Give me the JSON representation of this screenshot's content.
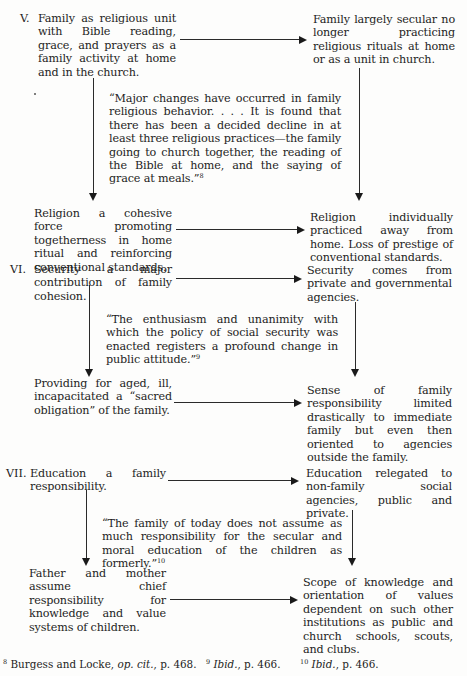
{
  "sections": [
    {
      "numeral": "V.",
      "left_top": "Family as religious unit with Bible reading, grace, and prayers as a family activity at home and in the church.",
      "right_top": "Family largely secular no longer practicing religious rituals at home or as a unit in church.",
      "quote": "“Major changes have occurred in family religious behavior. . . . It is found that there has been a decided decline in at least three religious practices—the family going to church together, the reading of the Bible at home, and the saying of grace at meals.”",
      "quote_ref": "8",
      "left_bottom": "Religion a cohesive force promoting togetherness in home ritual and reinforcing conventional standards.",
      "right_bottom": "Religion individually practiced away from home. Loss of prestige of conventional standards."
    },
    {
      "numeral": "VI.",
      "left_top": "Security a major contribution of family cohesion.",
      "right_top": "Security comes from private and governmental agencies.",
      "quote": "“The enthusiasm and unanimity with which the policy of social security was enacted registers a profound change in public attitude.”",
      "quote_ref": "9",
      "left_bottom": "Providing for aged, ill, incapacitated a “sacred obligation” of the family.",
      "right_bottom": "Sense of family responsibility limited drastically to immediate family but even then oriented to agencies outside the family."
    },
    {
      "numeral": "VII.",
      "left_top": "Education a family responsibility.",
      "right_top": "Education relegated to non-family social agencies, public and private.",
      "quote": "“The family of today does not assume as much responsibility for the secular and moral education of the children as formerly.”",
      "quote_ref": "10",
      "left_bottom": "Father and mother assume chief responsibility for knowledge and value systems of children.",
      "right_bottom": "Scope of knowledge and orientation of values dependent on such other institutions as public and church schools, scouts, and clubs."
    }
  ],
  "footnotes": [
    {
      "mark": "8",
      "author": "Burgess and Locke, ",
      "italic": "op. cit.",
      "rest": ", p. 468."
    },
    {
      "mark": "9",
      "author": "",
      "italic": "Ibid.",
      "rest": ", p. 466."
    },
    {
      "mark": "10",
      "author": "",
      "italic": "Ibid.",
      "rest": ", p. 466."
    }
  ]
}
